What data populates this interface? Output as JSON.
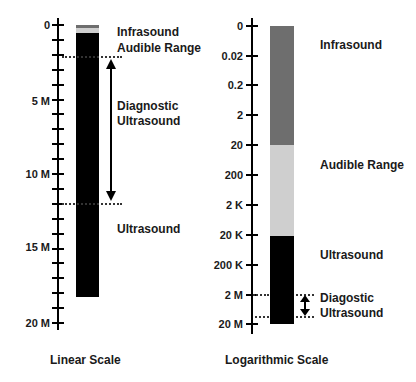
{
  "linear": {
    "caption": "Linear Scale",
    "ticks": [
      "0",
      "5 M",
      "10 M",
      "15 M",
      "20 M"
    ],
    "regions": {
      "infrasound": "Infrasound",
      "audible": "Audible Range",
      "diagnostic_line1": "Diagnostic",
      "diagnostic_line2": "Ultrasound",
      "ultrasound": "Ultrasound"
    }
  },
  "log": {
    "caption": "Logarithmic Scale",
    "ticks": [
      "0",
      "0.02",
      "0.2",
      "2",
      "20",
      "200",
      "2 K",
      "20 K",
      "200 K",
      "2 M",
      "20 M"
    ],
    "regions": {
      "infrasound": "Infrasound",
      "audible": "Audible Range",
      "ultrasound": "Ultrasound",
      "diagnostic_line1": "Diagostic",
      "diagnostic_line2": "Ultrasound"
    }
  },
  "colors": {
    "infrasound": "#6e6e6e",
    "audible": "#cfcfcf",
    "ultrasound": "#000000"
  }
}
